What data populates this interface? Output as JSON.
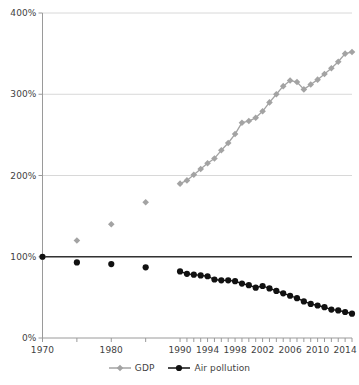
{
  "chart_data": {
    "type": "line",
    "title": "",
    "subtitle": "",
    "xlabel": "",
    "ylabel": "",
    "xlim": [
      1970,
      2015
    ],
    "ylim": [
      0,
      400
    ],
    "grid": true,
    "legend_position": "bottom",
    "y_ticks": [
      "0%",
      "100%",
      "200%",
      "300%",
      "400%"
    ],
    "y_tick_values": [
      0,
      100,
      200,
      300,
      400
    ],
    "x_ticks": [
      "1970",
      "1980",
      "1990",
      "1994",
      "1998",
      "2002",
      "2006",
      "2010",
      "2014"
    ],
    "x_tick_values": [
      1970,
      1980,
      1990,
      1994,
      1998,
      2002,
      2006,
      2010,
      2014
    ],
    "x_minor_tick_values": [
      1970,
      1975,
      1980,
      1985,
      1990,
      1991,
      1992,
      1993,
      1994,
      1995,
      1996,
      1997,
      1998,
      1999,
      2000,
      2001,
      2002,
      2003,
      2004,
      2005,
      2006,
      2007,
      2008,
      2009,
      2010,
      2011,
      2012,
      2013,
      2014,
      2015
    ],
    "reference_line": {
      "value": 100,
      "label": "100%",
      "color": "#333333"
    },
    "series": [
      {
        "name": "GDP",
        "color": "#a3a3a3",
        "marker": "diamond",
        "x": [
          1970,
          1975,
          1980,
          1985,
          1990,
          1991,
          1992,
          1993,
          1994,
          1995,
          1996,
          1997,
          1998,
          1999,
          2000,
          2001,
          2002,
          2003,
          2004,
          2005,
          2006,
          2007,
          2008,
          2009,
          2010,
          2011,
          2012,
          2013,
          2014,
          2015
        ],
        "values": [
          100,
          120,
          140,
          167,
          190,
          194,
          201,
          208,
          215,
          221,
          231,
          240,
          251,
          265,
          267,
          271,
          279,
          290,
          300,
          310,
          317,
          315,
          306,
          312,
          318,
          325,
          332,
          340,
          350,
          352
        ],
        "connected_from": 1990
      },
      {
        "name": "Air pollution",
        "color": "#111111",
        "marker": "circle",
        "x": [
          1970,
          1975,
          1980,
          1985,
          1990,
          1991,
          1992,
          1993,
          1994,
          1995,
          1996,
          1997,
          1998,
          1999,
          2000,
          2001,
          2002,
          2003,
          2004,
          2005,
          2006,
          2007,
          2008,
          2009,
          2010,
          2011,
          2012,
          2013,
          2014,
          2015
        ],
        "values": [
          100,
          93,
          91,
          87,
          82,
          79,
          78,
          77,
          76,
          72,
          71,
          71,
          70,
          67,
          65,
          62,
          64,
          61,
          58,
          55,
          52,
          49,
          45,
          42,
          40,
          38,
          35,
          34,
          32,
          30
        ],
        "connected_from": 1990
      }
    ]
  },
  "legend": {
    "items": [
      {
        "label": "GDP",
        "color": "#a3a3a3",
        "marker": "diamond"
      },
      {
        "label": "Air pollution",
        "color": "#111111",
        "marker": "circle"
      }
    ]
  },
  "colors": {
    "gdp": "#a3a3a3",
    "air_pollution": "#111111",
    "grid": "#d8d8d8",
    "axis": "#9a9a9a",
    "reference_line": "#333333",
    "text": "#3f3f3f",
    "background": "#ffffff"
  }
}
